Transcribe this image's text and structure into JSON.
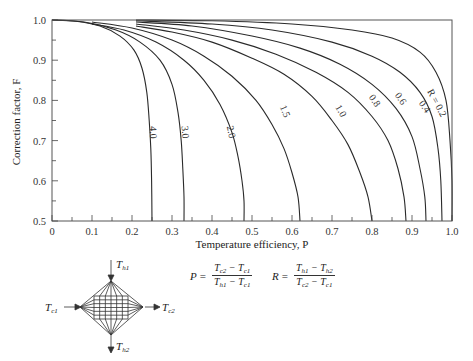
{
  "chart_data": {
    "type": "line",
    "title": "",
    "xlabel": "Temperature efficiency, P",
    "ylabel": "Correction factor, F",
    "xlim": [
      0,
      1.0
    ],
    "ylim": [
      0.5,
      1.0
    ],
    "x_ticks": [
      "0",
      "0.1",
      "0.2",
      "0.3",
      "0.4",
      "0.5",
      "0.6",
      "0.7",
      "0.8",
      "0.9",
      "1.0"
    ],
    "y_ticks": [
      "0.5",
      "0.6",
      "0.7",
      "0.8",
      "0.9",
      "1.0"
    ],
    "grid": false,
    "legend": "inline curve labels",
    "series": [
      {
        "name": "R = 0.2",
        "label": "R = 0.2",
        "points": [
          [
            0.21,
            1.0
          ],
          [
            0.4,
            0.998
          ],
          [
            0.6,
            0.99
          ],
          [
            0.75,
            0.975
          ],
          [
            0.85,
            0.955
          ],
          [
            0.92,
            0.92
          ],
          [
            0.96,
            0.87
          ],
          [
            0.985,
            0.8
          ],
          [
            0.995,
            0.7
          ],
          [
            1.0,
            0.6
          ],
          [
            1.0,
            0.5
          ]
        ]
      },
      {
        "name": "R = 0.4",
        "label": "0.4",
        "points": [
          [
            0.21,
            0.998
          ],
          [
            0.4,
            0.99
          ],
          [
            0.55,
            0.975
          ],
          [
            0.7,
            0.945
          ],
          [
            0.8,
            0.91
          ],
          [
            0.87,
            0.87
          ],
          [
            0.92,
            0.82
          ],
          [
            0.95,
            0.76
          ],
          [
            0.965,
            0.68
          ],
          [
            0.972,
            0.6
          ],
          [
            0.975,
            0.5
          ]
        ]
      },
      {
        "name": "R = 0.6",
        "label": "0.6",
        "points": [
          [
            0.21,
            0.995
          ],
          [
            0.35,
            0.985
          ],
          [
            0.5,
            0.96
          ],
          [
            0.62,
            0.93
          ],
          [
            0.72,
            0.89
          ],
          [
            0.8,
            0.84
          ],
          [
            0.86,
            0.78
          ],
          [
            0.9,
            0.71
          ],
          [
            0.92,
            0.63
          ],
          [
            0.932,
            0.56
          ],
          [
            0.935,
            0.5
          ]
        ]
      },
      {
        "name": "R = 0.8",
        "label": "0.8",
        "points": [
          [
            0.21,
            0.99
          ],
          [
            0.33,
            0.975
          ],
          [
            0.45,
            0.95
          ],
          [
            0.56,
            0.915
          ],
          [
            0.66,
            0.87
          ],
          [
            0.74,
            0.82
          ],
          [
            0.8,
            0.76
          ],
          [
            0.84,
            0.7
          ],
          [
            0.865,
            0.63
          ],
          [
            0.88,
            0.56
          ],
          [
            0.885,
            0.5
          ]
        ]
      },
      {
        "name": "R = 1.0",
        "label": "1.0",
        "points": [
          [
            0.21,
            0.985
          ],
          [
            0.3,
            0.97
          ],
          [
            0.4,
            0.945
          ],
          [
            0.5,
            0.905
          ],
          [
            0.58,
            0.865
          ],
          [
            0.65,
            0.81
          ],
          [
            0.7,
            0.75
          ],
          [
            0.74,
            0.69
          ],
          [
            0.77,
            0.62
          ],
          [
            0.79,
            0.56
          ],
          [
            0.8,
            0.5
          ]
        ]
      },
      {
        "name": "R = 1.5",
        "label": "1.5",
        "points": [
          [
            0.1,
            0.995
          ],
          [
            0.2,
            0.98
          ],
          [
            0.3,
            0.95
          ],
          [
            0.38,
            0.91
          ],
          [
            0.45,
            0.86
          ],
          [
            0.51,
            0.8
          ],
          [
            0.55,
            0.74
          ],
          [
            0.58,
            0.68
          ],
          [
            0.6,
            0.62
          ],
          [
            0.615,
            0.56
          ],
          [
            0.62,
            0.5
          ]
        ]
      },
      {
        "name": "R = 2.0",
        "label": "2.0",
        "points": [
          [
            0.1,
            0.99
          ],
          [
            0.18,
            0.975
          ],
          [
            0.26,
            0.945
          ],
          [
            0.33,
            0.9
          ],
          [
            0.38,
            0.85
          ],
          [
            0.42,
            0.79
          ],
          [
            0.45,
            0.72
          ],
          [
            0.465,
            0.66
          ],
          [
            0.475,
            0.6
          ],
          [
            0.48,
            0.55
          ],
          [
            0.48,
            0.5
          ]
        ]
      },
      {
        "name": "R = 3.0",
        "label": "3.0",
        "points": [
          [
            0.0,
            1.0
          ],
          [
            0.08,
            0.995
          ],
          [
            0.16,
            0.975
          ],
          [
            0.22,
            0.945
          ],
          [
            0.27,
            0.9
          ],
          [
            0.3,
            0.84
          ],
          [
            0.315,
            0.77
          ],
          [
            0.323,
            0.7
          ],
          [
            0.327,
            0.63
          ],
          [
            0.33,
            0.56
          ],
          [
            0.33,
            0.5
          ]
        ]
      },
      {
        "name": "R = 4.0",
        "label": "4.0",
        "points": [
          [
            0.0,
            1.0
          ],
          [
            0.06,
            0.997
          ],
          [
            0.12,
            0.985
          ],
          [
            0.17,
            0.96
          ],
          [
            0.205,
            0.925
          ],
          [
            0.225,
            0.88
          ],
          [
            0.237,
            0.82
          ],
          [
            0.243,
            0.75
          ],
          [
            0.247,
            0.68
          ],
          [
            0.249,
            0.6
          ],
          [
            0.25,
            0.5
          ]
        ]
      }
    ],
    "annotations": {
      "P_formula": "P = (Tc2 − Tc1) / (Th1 − Tc1)",
      "R_formula": "R = (Th1 − Th2) / (Tc2 − Tc1)",
      "diagram_labels": [
        "Th1",
        "Th2",
        "Tc1",
        "Tc2"
      ]
    }
  },
  "labels": {
    "ylabel": "Correction factor, F",
    "xlabel": "Temperature efficiency, P"
  },
  "formula": {
    "p_lhs": "P",
    "r_lhs": "R",
    "eq": "=",
    "p_num_a": "T",
    "p_num_a_sub": "c2",
    "p_num_b": "T",
    "p_num_b_sub": "c1",
    "p_den_a": "T",
    "p_den_a_sub": "h1",
    "p_den_b": "T",
    "p_den_b_sub": "c1",
    "r_num_a": "T",
    "r_num_a_sub": "h1",
    "r_num_b": "T",
    "r_num_b_sub": "h2",
    "r_den_a": "T",
    "r_den_a_sub": "c2",
    "r_den_b": "T",
    "r_den_b_sub": "c1",
    "minus": " − "
  },
  "diagram": {
    "th1": "T",
    "th1_sub": "h1",
    "th2": "T",
    "th2_sub": "h2",
    "tc1": "T",
    "tc1_sub": "c1",
    "tc2": "T",
    "tc2_sub": "c2"
  }
}
